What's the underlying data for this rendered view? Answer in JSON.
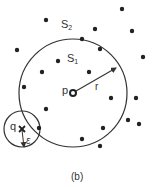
{
  "figure": {
    "caption": "(b)",
    "labels": {
      "set_outer": "S",
      "set_outer_sub": "2",
      "set_inner": "S",
      "set_inner_sub": "1",
      "center_point": "p",
      "radius": "r",
      "query_point": "q",
      "epsilon": "ε"
    },
    "colors": {
      "stroke": "#333333",
      "point": "#222222",
      "background": "#ffffff"
    },
    "big_circle": {
      "cx": 73,
      "cy": 93,
      "r": 54
    },
    "small_circle": {
      "cx": 22,
      "cy": 129,
      "r": 18
    },
    "radius_arrow": {
      "x1": 76,
      "y1": 91,
      "x2": 116,
      "y2": 68
    },
    "epsilon_arrow": {
      "x1": 22,
      "y1": 130,
      "x2": 24,
      "y2": 147
    },
    "points": [
      [
        46,
        20
      ],
      [
        122,
        9
      ],
      [
        95,
        29
      ],
      [
        132,
        31
      ],
      [
        82,
        39
      ],
      [
        17,
        50
      ],
      [
        100,
        49
      ],
      [
        58,
        61
      ],
      [
        143,
        57
      ],
      [
        42,
        72
      ],
      [
        89,
        72
      ],
      [
        24,
        87
      ],
      [
        111,
        98
      ],
      [
        136,
        98
      ],
      [
        46,
        109
      ],
      [
        128,
        120
      ],
      [
        139,
        124
      ],
      [
        39,
        128
      ],
      [
        103,
        128
      ],
      [
        82,
        139
      ],
      [
        100,
        146
      ]
    ]
  }
}
